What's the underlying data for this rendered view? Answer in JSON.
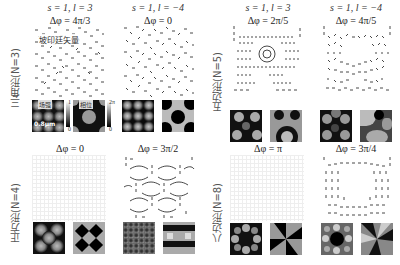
{
  "column_headers": [
    {
      "text": "s = 1, l = 3"
    },
    {
      "text": "s = 1, l = −4"
    },
    {
      "text": "s = 1, l = 3"
    },
    {
      "text": "s = 1, l = −4"
    }
  ],
  "row_labels": {
    "triangle": "三角形(N=3)",
    "square": "正方形(N=4)",
    "pentagon": "五边形(N=5)",
    "octagon": "八边形(N=8)"
  },
  "panels": {
    "tri_l3": {
      "dphi": "Δφ = 4π/3"
    },
    "tri_lm4": {
      "dphi": "Δφ = 0"
    },
    "pent_l3": {
      "dphi": "Δφ = 2π/5"
    },
    "pent_lm4": {
      "dphi": "Δφ = 4π/5"
    },
    "sq_l3": {
      "dphi": "Δφ = 0"
    },
    "sq_lm4": {
      "dphi": "Δφ = 3π/2"
    },
    "oct_l3": {
      "dphi": "Δφ = π"
    },
    "oct_lm4": {
      "dphi": "Δφ = 3π/4"
    }
  },
  "annotations": {
    "poynting": "坡印廷矢量",
    "intensity_label": "场强",
    "phase_label": "相位",
    "scale_bar": "0.8μm",
    "intensity_cbar_max": "1",
    "intensity_cbar_min": "0",
    "phase_cbar_max": "2π",
    "phase_cbar_min": "0"
  }
}
